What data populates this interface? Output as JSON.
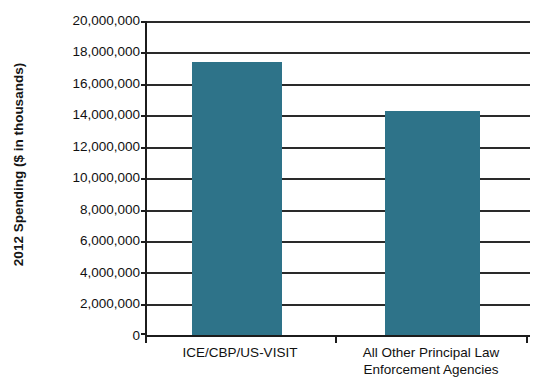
{
  "chart_data": {
    "type": "bar",
    "title": "",
    "subtitle": "",
    "xlabel": "",
    "ylabel": "2012 Spending ($ in thousands)",
    "categories": [
      "ICE/CBP/US-VISIT",
      "All Other Principal Law Enforcement Agencies"
    ],
    "category_lines": [
      [
        "ICE/CBP/US-VISIT"
      ],
      [
        "All Other Principal Law",
        "Enforcement Agencies"
      ]
    ],
    "values": [
      17400000,
      14300000
    ],
    "ylim": [
      0,
      20000000
    ],
    "ytick_step": 2000000,
    "ytick_labels": [
      "20,000,000",
      "18,000,000",
      "16,000,000",
      "14,000,000",
      "12,000,000",
      "10,000,000",
      "8,000,000",
      "6,000,000",
      "4,000,000",
      "2,000,000",
      "0"
    ],
    "ytick_values": [
      20000000,
      18000000,
      16000000,
      14000000,
      12000000,
      10000000,
      8000000,
      6000000,
      4000000,
      2000000,
      0
    ],
    "grid": true,
    "grid_axis": "y",
    "legend": false,
    "legend_position": "none",
    "bar_color": "#2e7389",
    "axis_color": "#1c1c1c",
    "background_color": "#ffffff"
  }
}
